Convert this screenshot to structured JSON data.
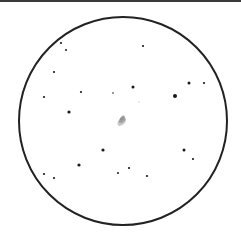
{
  "field": {
    "center": [
      123,
      121
    ],
    "radius": 104,
    "stroke": "#222222",
    "stroke_width": 2
  },
  "galaxy": {
    "x": 122,
    "y": 120,
    "rx": 5,
    "ry": 3,
    "angle": -40,
    "color": "#8a8a8a"
  },
  "stars": [
    {
      "x": 61,
      "y": 43,
      "r": 1.1
    },
    {
      "x": 66,
      "y": 50,
      "r": 1.0
    },
    {
      "x": 143,
      "y": 46,
      "r": 1.1
    },
    {
      "x": 54,
      "y": 72,
      "r": 1.1
    },
    {
      "x": 44,
      "y": 97,
      "r": 1.1
    },
    {
      "x": 81,
      "y": 92,
      "r": 1.1
    },
    {
      "x": 113,
      "y": 93,
      "r": 0.8
    },
    {
      "x": 133,
      "y": 87,
      "r": 1.5
    },
    {
      "x": 189,
      "y": 83,
      "r": 1.5
    },
    {
      "x": 204,
      "y": 83,
      "r": 1.1
    },
    {
      "x": 175,
      "y": 96,
      "r": 2.0
    },
    {
      "x": 69,
      "y": 112,
      "r": 1.6
    },
    {
      "x": 139,
      "y": 102,
      "r": 0.7,
      "color": "#cccccc"
    },
    {
      "x": 103,
      "y": 150,
      "r": 1.6
    },
    {
      "x": 184,
      "y": 150,
      "r": 1.5
    },
    {
      "x": 193,
      "y": 159,
      "r": 1.1
    },
    {
      "x": 79,
      "y": 165,
      "r": 1.6
    },
    {
      "x": 44,
      "y": 174,
      "r": 1.1
    },
    {
      "x": 54,
      "y": 178,
      "r": 1.1
    },
    {
      "x": 118,
      "y": 173,
      "r": 1.0
    },
    {
      "x": 129,
      "y": 168,
      "r": 1.1
    },
    {
      "x": 147,
      "y": 176,
      "r": 1.1
    }
  ]
}
